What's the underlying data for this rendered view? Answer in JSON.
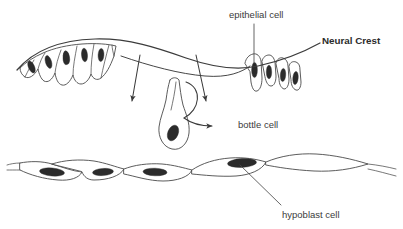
{
  "figure": {
    "title": "Neural Crest",
    "background_color": "#ffffff",
    "line_color": "#3c3c3c",
    "nucleus_color": "#2b2b2b",
    "text_color": "#3b3b3b",
    "width": 403,
    "height": 229
  },
  "labels": {
    "epithelial_cell": "epithelial cell",
    "neural_crest": "Neural Crest",
    "bottle_cell": "bottle cell",
    "hypoblast_cell": "hypoblast cell"
  },
  "structures": {
    "epidermis_label": "epithelial sheet",
    "bottle_cell_label": "bottle cell",
    "hypoblast_label": "hypoblast layer",
    "left_cluster_cell_count": 6,
    "right_cluster_cell_count": 4,
    "hypoblast_cell_count": 5,
    "migration_arrow_count": 2,
    "ingression_arrow_count": 1
  }
}
